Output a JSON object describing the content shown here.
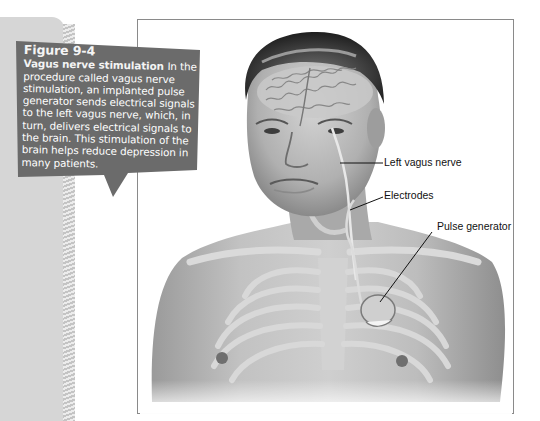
{
  "callout": {
    "figure_number": "Figure 9-4",
    "title": "Vagus nerve stimulation",
    "body": "In the procedure called vagus nerve stimulation, an implanted pulse generator sends electrical signals to the left vagus nerve, which, in turn, delivers electrical signals to the brain. This stimulation of the brain helps reduce depression in many patients.",
    "background_color": "#6b6b6b",
    "text_color": "#ffffff"
  },
  "illustration": {
    "subject": "Human head and torso with brain, vagus nerve, electrodes, and implanted pulse generator",
    "labels": [
      {
        "text": "Left vagus nerve"
      },
      {
        "text": "Electrodes"
      },
      {
        "text": "Pulse generator"
      }
    ]
  },
  "colors": {
    "page_strip": "#d6d6d6",
    "frame_border": "#8a8a8a",
    "skin": "#b8b8b8"
  }
}
